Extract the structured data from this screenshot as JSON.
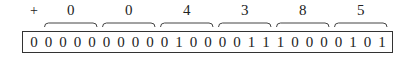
{
  "sign": "+",
  "hex_digits": [
    "0",
    "0",
    "4",
    "3",
    "8",
    "5"
  ],
  "leading_bit": "0",
  "bits": [
    "0",
    "0",
    "0",
    "0",
    "0",
    "0",
    "0",
    "0",
    "0",
    "1",
    "0",
    "0",
    "0",
    "0",
    "1",
    "1",
    "1",
    "0",
    "0",
    "0",
    "0",
    "1",
    "0",
    "1"
  ]
}
